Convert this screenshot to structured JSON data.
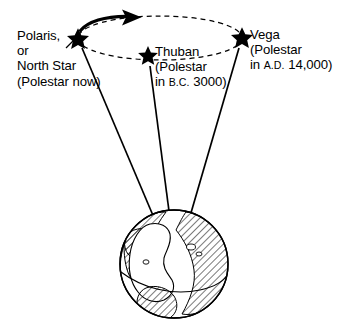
{
  "figure": {
    "kind": "diagram",
    "background_color": "#ffffff",
    "ink_color": "#000000"
  },
  "labels": {
    "polaris": {
      "name": "Polaris label",
      "lines": [
        "Polaris,",
        "or",
        "North Star",
        "(Polestar now)"
      ]
    },
    "thuban": {
      "name": "Thuban label",
      "line1": "Thuban",
      "line2": "(Polestar",
      "line3_prefix": "in ",
      "line3_era": "B.C.",
      "line3_suffix": " 3000)"
    },
    "vega": {
      "name": "Vega label",
      "line1": "Vega",
      "line2": "(Polestar",
      "line3_prefix": "in ",
      "line3_era": "A.D.",
      "line3_suffix": " 14,000)"
    }
  },
  "markers": {
    "stars": [
      {
        "id": "polaris",
        "label": "Polaris",
        "x": 78,
        "y": 39,
        "size": 11
      },
      {
        "id": "thuban",
        "label": "Thuban",
        "x": 148,
        "y": 56,
        "size": 10
      },
      {
        "id": "vega",
        "label": "Vega",
        "x": 242,
        "y": 38,
        "size": 11
      }
    ]
  },
  "precession_path": {
    "name": "precession-ellipse",
    "style": "dashed",
    "center_x": 160,
    "center_y": 38,
    "radius_x": 82,
    "radius_y": 22,
    "dash": "5 4",
    "direction_arc": {
      "style": "solid",
      "stroke_width": 3.2,
      "arrow_tip_x": 140,
      "arrow_tip_y": 17
    }
  },
  "sight_lines": [
    {
      "from": "polaris",
      "x1": 82,
      "y1": 48,
      "x2": 160,
      "y2": 232
    },
    {
      "from": "thuban",
      "x1": 150,
      "y1": 66,
      "x2": 172,
      "y2": 234
    },
    {
      "from": "vega",
      "x1": 239,
      "y1": 48,
      "x2": 186,
      "y2": 230
    }
  ],
  "earth": {
    "name": "earth-globe",
    "center_x": 174,
    "center_y": 264,
    "radius": 54,
    "hatch_angle_deg": 45,
    "features": [
      "north-america",
      "south-america",
      "greenland",
      "africa-edge",
      "equator-arc"
    ]
  }
}
